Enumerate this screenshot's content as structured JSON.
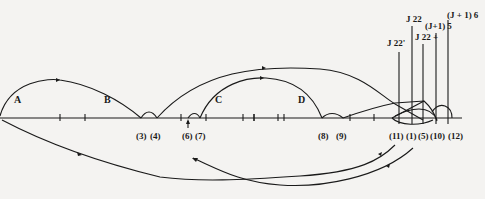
{
  "figure": {
    "segments": [
      {
        "id": "A",
        "label": "A",
        "x": 14,
        "y": 98
      },
      {
        "id": "B",
        "label": "B",
        "x": 104,
        "y": 98
      },
      {
        "id": "C",
        "label": "C",
        "x": 215,
        "y": 98
      },
      {
        "id": "D",
        "label": "D",
        "x": 298,
        "y": 98
      }
    ],
    "points": [
      {
        "label": "(3)",
        "x": 137
      },
      {
        "label": "(4)",
        "x": 152
      },
      {
        "label": "(6)",
        "x": 183
      },
      {
        "label": "(7)",
        "x": 196
      },
      {
        "label": "(8)",
        "x": 317
      },
      {
        "label": "(9)",
        "x": 337
      },
      {
        "label": "(11)",
        "x": 389
      },
      {
        "label": "(1)",
        "x": 406
      },
      {
        "label": "(5)",
        "x": 419
      },
      {
        "label": "(10)",
        "x": 432
      },
      {
        "label": "(12)",
        "x": 451
      }
    ],
    "markers": [
      {
        "label": "J 22'",
        "x": 390,
        "top": 48
      },
      {
        "label": "J 22",
        "x": 405,
        "top": 22
      },
      {
        "label": "J 22 +",
        "x": 417,
        "top": 40
      },
      {
        "label": "(J+1) 5",
        "x": 427,
        "top": 30
      },
      {
        "label": "(J + 1) 6",
        "x": 447,
        "top": 16
      }
    ],
    "colors": {
      "ink": "#1a1a1a",
      "paper": "#f4f3f1"
    }
  }
}
